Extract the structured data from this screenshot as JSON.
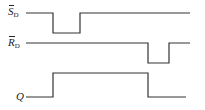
{
  "diagram": {
    "type": "timing-diagram",
    "signals": [
      {
        "id": "sd",
        "name": "S",
        "subscript": "D",
        "overbar": true,
        "waveform": "high, pulse low, high",
        "levels": [
          1,
          0,
          1
        ]
      },
      {
        "id": "rd",
        "name": "R",
        "subscript": "D",
        "overbar": true,
        "waveform": "high, pulse low, high",
        "levels": [
          1,
          0,
          1
        ]
      },
      {
        "id": "q",
        "name": "Q",
        "subscript": "",
        "overbar": false,
        "waveform": "low, high, low",
        "levels": [
          0,
          1,
          0
        ]
      }
    ],
    "colors": {
      "line": "#333333",
      "background": "#ffffff"
    }
  }
}
